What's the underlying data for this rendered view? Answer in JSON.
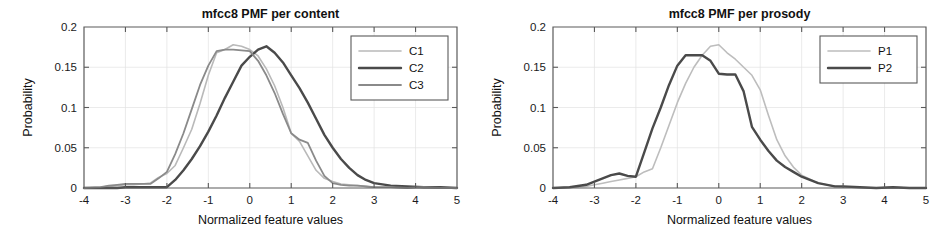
{
  "figure": {
    "background": "#ffffff",
    "width": 939,
    "height": 247,
    "panel_count": 2
  },
  "chart_data": [
    {
      "type": "line",
      "id": "mfcc8-pmf-per-content",
      "title": "mfcc8 PMF per content",
      "xlabel": "Normalized feature values",
      "ylabel": "Probability",
      "xlim": [
        -4,
        5
      ],
      "ylim": [
        0,
        0.2
      ],
      "xticks": [
        -4,
        -3,
        -2,
        -1,
        0,
        1,
        2,
        3,
        4,
        5
      ],
      "xticklabels": [
        "-4",
        "-3",
        "-2",
        "-1",
        "0",
        "1",
        "2",
        "3",
        "4",
        "5"
      ],
      "yticks": [
        0,
        0.05,
        0.1,
        0.15,
        0.2
      ],
      "yticklabels": [
        "0",
        "0.05",
        "0.1",
        "0.15",
        "0.2"
      ],
      "grid": false,
      "legend_position": "upper right",
      "x": [
        -4.0,
        -3.6,
        -3.4,
        -3.2,
        -3.0,
        -2.8,
        -2.6,
        -2.4,
        -2.2,
        -2.0,
        -1.8,
        -1.6,
        -1.4,
        -1.2,
        -1.0,
        -0.8,
        -0.6,
        -0.4,
        -0.2,
        0.0,
        0.2,
        0.4,
        0.6,
        0.8,
        1.0,
        1.2,
        1.4,
        1.6,
        1.8,
        2.0,
        2.2,
        2.4,
        2.6,
        2.8,
        3.0,
        3.4,
        3.8,
        4.2,
        4.6,
        5.0
      ],
      "series": [
        {
          "name": "C1",
          "color": "#b9b9b9",
          "width": 1.6,
          "values": [
            0.0,
            0.001,
            0.002,
            0.003,
            0.004,
            0.004,
            0.005,
            0.006,
            0.013,
            0.018,
            0.028,
            0.05,
            0.073,
            0.105,
            0.14,
            0.168,
            0.172,
            0.178,
            0.176,
            0.172,
            0.164,
            0.148,
            0.127,
            0.1,
            0.068,
            0.058,
            0.04,
            0.022,
            0.012,
            0.008,
            0.005,
            0.004,
            0.003,
            0.002,
            0.001,
            0.001,
            0.0,
            0.001,
            0.0,
            0.0
          ]
        },
        {
          "name": "C2",
          "color": "#4a4a4a",
          "width": 2.4,
          "values": [
            0.0,
            0.0,
            0.0,
            0.0,
            0.001,
            0.001,
            0.001,
            0.001,
            0.001,
            0.001,
            0.01,
            0.022,
            0.036,
            0.052,
            0.07,
            0.09,
            0.112,
            0.132,
            0.152,
            0.163,
            0.172,
            0.176,
            0.168,
            0.156,
            0.14,
            0.124,
            0.106,
            0.086,
            0.066,
            0.05,
            0.036,
            0.025,
            0.016,
            0.01,
            0.006,
            0.003,
            0.002,
            0.001,
            0.001,
            0.0
          ]
        },
        {
          "name": "C3",
          "color": "#8a8a8a",
          "width": 1.8,
          "values": [
            0.0,
            0.001,
            0.003,
            0.004,
            0.005,
            0.005,
            0.005,
            0.005,
            0.012,
            0.02,
            0.042,
            0.068,
            0.098,
            0.128,
            0.152,
            0.17,
            0.172,
            0.172,
            0.171,
            0.17,
            0.158,
            0.14,
            0.118,
            0.092,
            0.068,
            0.06,
            0.056,
            0.034,
            0.015,
            0.006,
            0.004,
            0.003,
            0.003,
            0.002,
            0.001,
            0.001,
            0.0,
            0.001,
            0.0,
            0.0
          ]
        }
      ]
    },
    {
      "type": "line",
      "id": "mfcc8-pmf-per-prosody",
      "title": "mfcc8 PMF per prosody",
      "xlabel": "Normalized feature values",
      "ylabel": "Probability",
      "xlim": [
        -4,
        5
      ],
      "ylim": [
        0,
        0.2
      ],
      "xticks": [
        -4,
        -3,
        -2,
        -1,
        0,
        1,
        2,
        3,
        4,
        5
      ],
      "xticklabels": [
        "-4",
        "-3",
        "-2",
        "-1",
        "0",
        "1",
        "2",
        "3",
        "4",
        "5"
      ],
      "yticks": [
        0,
        0.05,
        0.1,
        0.15,
        0.2
      ],
      "yticklabels": [
        "0",
        "0.05",
        "0.1",
        "0.15",
        "0.2"
      ],
      "grid": false,
      "legend_position": "upper right",
      "x": [
        -4.0,
        -3.6,
        -3.2,
        -3.0,
        -2.8,
        -2.6,
        -2.4,
        -2.2,
        -2.0,
        -1.8,
        -1.6,
        -1.4,
        -1.2,
        -1.0,
        -0.8,
        -0.6,
        -0.4,
        -0.2,
        0.0,
        0.2,
        0.4,
        0.6,
        0.8,
        1.0,
        1.2,
        1.4,
        1.6,
        1.8,
        2.0,
        2.4,
        2.8,
        3.0,
        3.4,
        3.8,
        4.2,
        4.6,
        5.0
      ],
      "series": [
        {
          "name": "P1",
          "color": "#bdbdbd",
          "width": 1.6,
          "values": [
            0.0,
            0.001,
            0.002,
            0.004,
            0.006,
            0.008,
            0.01,
            0.012,
            0.014,
            0.02,
            0.024,
            0.05,
            0.078,
            0.106,
            0.13,
            0.15,
            0.165,
            0.176,
            0.178,
            0.168,
            0.16,
            0.15,
            0.14,
            0.122,
            0.09,
            0.06,
            0.04,
            0.026,
            0.016,
            0.006,
            0.002,
            0.001,
            0.001,
            0.0,
            0.001,
            0.0,
            0.0
          ]
        },
        {
          "name": "P2",
          "color": "#4a4a4a",
          "width": 2.4,
          "values": [
            0.0,
            0.001,
            0.004,
            0.008,
            0.012,
            0.016,
            0.018,
            0.015,
            0.014,
            0.044,
            0.074,
            0.1,
            0.128,
            0.152,
            0.165,
            0.165,
            0.165,
            0.158,
            0.142,
            0.141,
            0.141,
            0.12,
            0.076,
            0.06,
            0.046,
            0.034,
            0.026,
            0.02,
            0.014,
            0.006,
            0.002,
            0.002,
            0.001,
            0.0,
            0.001,
            0.0,
            0.0
          ]
        }
      ]
    }
  ]
}
